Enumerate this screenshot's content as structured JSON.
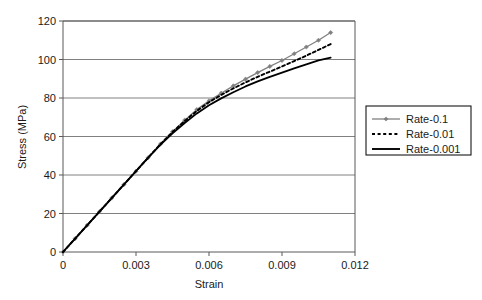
{
  "chart_data": {
    "type": "line",
    "title": "",
    "xlabel": "Strain",
    "ylabel": "Stress (MPa)",
    "xlim": [
      0,
      0.012
    ],
    "ylim": [
      0,
      120
    ],
    "xticks": [
      0,
      0.003,
      0.006,
      0.009,
      0.012
    ],
    "xtick_labels": [
      "0",
      "0.003",
      "0.006",
      "0.009",
      "0.012"
    ],
    "yticks": [
      0,
      20,
      40,
      60,
      80,
      100,
      120
    ],
    "ytick_labels": [
      "0",
      "20",
      "40",
      "60",
      "80",
      "100",
      "120"
    ],
    "grid": "horizontal",
    "legend_position": "right",
    "series": [
      {
        "name": "Rate-0.1",
        "color": "#808080",
        "style": "solid-marker",
        "marker": "diamond",
        "x": [
          0,
          0.0005,
          0.001,
          0.0015,
          0.002,
          0.0025,
          0.003,
          0.0035,
          0.004,
          0.0045,
          0.005,
          0.0055,
          0.006,
          0.0065,
          0.007,
          0.0075,
          0.008,
          0.0085,
          0.009,
          0.0095,
          0.01,
          0.0105,
          0.011
        ],
        "y": [
          0,
          7.0,
          14.0,
          21.0,
          28.0,
          35.0,
          42.0,
          49.0,
          56.0,
          62.5,
          68.5,
          74.0,
          78.5,
          82.5,
          86.3,
          89.8,
          93.2,
          96.4,
          99.5,
          103.0,
          106.5,
          110.0,
          114.0
        ]
      },
      {
        "name": "Rate-0.01",
        "color": "#000000",
        "style": "dotted",
        "marker": "none",
        "x": [
          0,
          0.0005,
          0.001,
          0.0015,
          0.002,
          0.0025,
          0.003,
          0.0035,
          0.004,
          0.0045,
          0.005,
          0.0055,
          0.006,
          0.0065,
          0.007,
          0.0075,
          0.008,
          0.0085,
          0.009,
          0.0095,
          0.01,
          0.0105,
          0.011
        ],
        "y": [
          0,
          7.0,
          14.0,
          21.0,
          28.0,
          35.0,
          42.0,
          49.0,
          56.0,
          62.3,
          68.0,
          73.3,
          77.8,
          81.6,
          85.0,
          88.1,
          91.0,
          93.7,
          96.4,
          99.2,
          102.0,
          105.0,
          108.0
        ]
      },
      {
        "name": "Rate-0.001",
        "color": "#000000",
        "style": "solid",
        "marker": "none",
        "x": [
          0,
          0.0005,
          0.001,
          0.0015,
          0.002,
          0.0025,
          0.003,
          0.0035,
          0.004,
          0.0045,
          0.005,
          0.0055,
          0.006,
          0.0065,
          0.007,
          0.0075,
          0.008,
          0.0085,
          0.009,
          0.0095,
          0.01,
          0.0105,
          0.011
        ],
        "y": [
          0,
          7.0,
          14.0,
          21.0,
          28.0,
          35.0,
          42.0,
          49.0,
          55.6,
          61.6,
          67.0,
          72.0,
          76.2,
          79.8,
          83.0,
          86.0,
          88.6,
          91.0,
          93.2,
          95.4,
          97.5,
          99.5,
          101.0
        ]
      }
    ]
  },
  "legend": {
    "items": [
      {
        "label": "Rate-0.1"
      },
      {
        "label": "Rate-0.01"
      },
      {
        "label": "Rate-0.001"
      }
    ]
  },
  "colors": {
    "series_gray": "#808080",
    "series_black": "#000000",
    "gridline": "#808080",
    "axis": "#595959",
    "background": "#ffffff"
  }
}
